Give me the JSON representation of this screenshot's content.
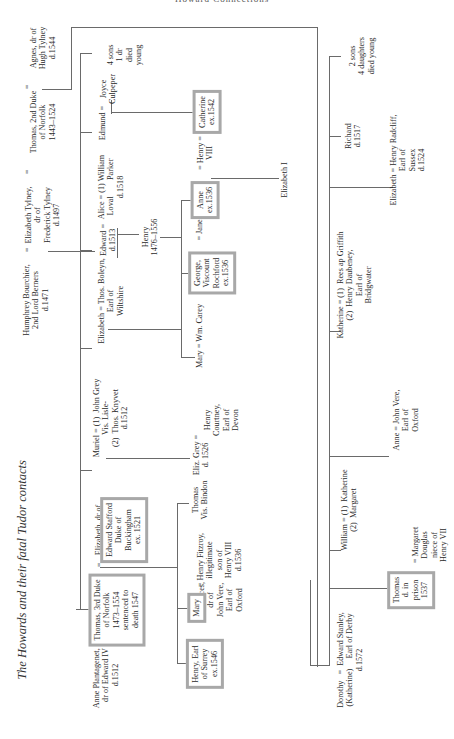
{
  "page": {
    "running_header": "Howard Connections",
    "title": "The Howards and their fatal Tudor contacts"
  },
  "generation1": {
    "humphrey_bourchier": "Humphrey Bourchier,\n2nd Lord Berners\nd.1471",
    "eq1": "=",
    "elizabeth_tylney": "Elizabeth Tylney,\ndr of\nFrederick Tylney\nd.1497",
    "eq2": "=",
    "thomas_2nd_duke": "Thomas, 2nd Duke\nof Norfolk\n1443–1524",
    "eq3": "=",
    "agnes": "Agnes, dr of\nHugh Tylney\nd.1544"
  },
  "generation2_first_marriage": {
    "anne_plantagenet": "Anne Plantagenet, =\ndr of Edward IV\nd.1512",
    "thomas_3rd_duke": "Thomas, 3rd Duke\nof Norfolk\n1473–1554\nsentenced to\ndeath 1547",
    "eq": "=",
    "elizabeth_stafford": "Elizabeth, dr of",
    "edward_stafford": "Edward Stafford\nDuke of\nBuckingham\nex. 1521",
    "muriel": "Muriel = (1)  John Grey\nVis. Lisle-\n(2)  Thos. Knyvet\nd.1512",
    "elizabeth_boleyn": "Elizabeth = Thos. Boleyn,\nEarl of\nWiltshire",
    "edward": "Edward =\nd.1513",
    "alice": "Alice = (1) William\nLoval        Parker\nd.1518",
    "edmund": "Edmund =",
    "joyce": "Joyce\nCulpeper",
    "four_sons": "4 sons\n1 dr\ndied\nyoung"
  },
  "generation3_first_marriage": {
    "henry_surrey": "Henry, Earl\nof Surrey\nex.1546",
    "frances": "=  Frances,\ndr of\nJohn Vere,\nEarl of\nOxford",
    "mary": "Mary",
    "henry_fitzroy": "= Henry Fitzroy,\nillegitimate\nson of\nHenry VIII\nd.1536",
    "thomas_bindon": "Thomas\nVis. Bindon",
    "eliz_grey": "Eliz. Grey =\nd. 1526",
    "henry_courtney": "Henry\nCourtney,\nEarl of\nDevon",
    "mary_carey": "Mary = Wm. Carey",
    "george_rochford": "George,\nViscount\nRochford\nex.1536",
    "jane": "= Jane",
    "henry_1476": "Henry\n1476–1556",
    "anne_boleyn": "Anne\nex.1536",
    "henry_viii": "= Henry =\nVIII",
    "catherine_howard": "Catherine\nex.1542",
    "elizabeth_i": "Elizabeth I"
  },
  "generation2_second_marriage": {
    "dorothy": "Dorothy   =  Edward Stanley,\n(Katherine)     Earl of Derby\nd.1572",
    "thomas_prison": "Thomas\nd. in\nprison\n1537",
    "margaret_douglas": "= Margaret\nDouglas\nniece of\nHenry VII",
    "william": "William = (1)  Katherine\n(2)  Margaret",
    "anne_vere": "Anne = John Vere,\nEarl of\nOxford",
    "katherine": "Katherine = (1)  Rees ap Griffith\n(2)  Henry Daubeney,\nEarl of\nBridgwater",
    "elizabeth_radcliff": "Elizabeth = Henry Radcliff,\nEarl of\nSussex\nd.1524",
    "richard": "Richard\nd.1517",
    "two_sons": "2 sons\n4 daughters\ndied young"
  }
}
